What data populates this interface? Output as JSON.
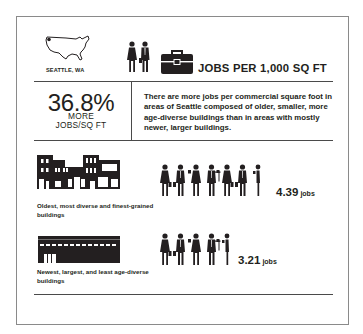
{
  "header": {
    "location_label": "SEATTLE, WA",
    "title": "JOBS PER 1,000 SQ FT",
    "icons": [
      "us-map-icon",
      "workers-icon",
      "briefcase-icon"
    ]
  },
  "summary": {
    "percent": "36.8%",
    "line1": "MORE",
    "line2": "JOBS/SQ FT",
    "description": "There are more jobs per commercial square foot in areas of Seattle composed of older, smaller, more age-diverse buildings than in areas with mostly newer, larger buildings."
  },
  "comparisons": [
    {
      "caption": "Oldest, most diverse and finest-grained buildings",
      "value": "4.39",
      "unit": "jobs",
      "people_count": 7,
      "icon": "old-buildings-icon"
    },
    {
      "caption": "Newest, largest, and least age-diverse buildings",
      "value": "3.21",
      "unit": "jobs",
      "people_count": 5,
      "icon": "new-building-icon"
    }
  ],
  "colors": {
    "ink": "#231f20",
    "border": "#8a8a8a",
    "rule": "#4a4a4a",
    "background": "#ffffff"
  }
}
